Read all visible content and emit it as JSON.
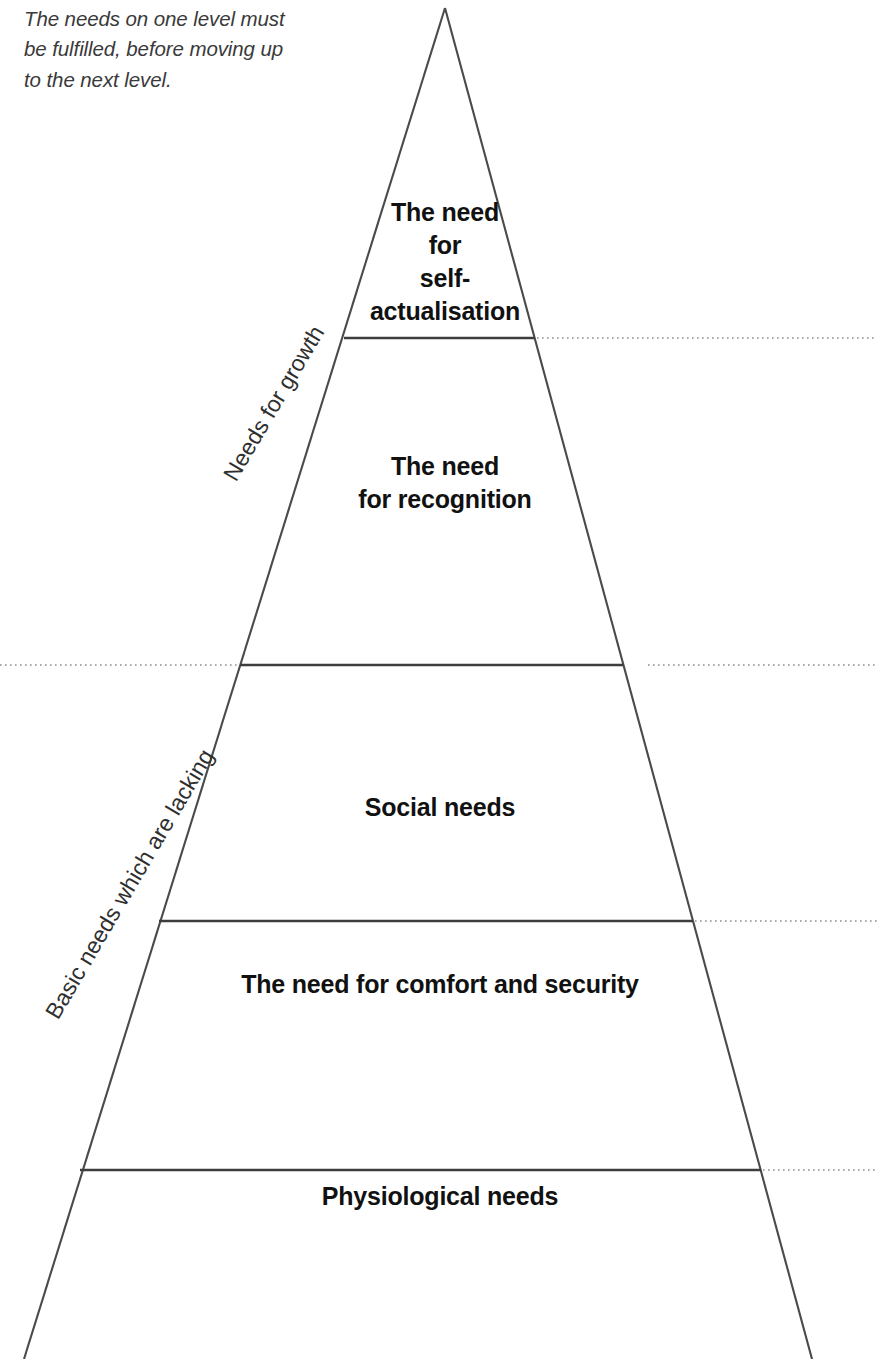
{
  "intro": {
    "text": "The needs on one level must\nbe fulfilled, before moving up\nto the next level."
  },
  "diagram": {
    "apex_x": 445,
    "tiers": [
      {
        "id": "self-actualisation",
        "label": "The need\nfor\nself-\nactualisation",
        "order": 5,
        "divider_y": 338,
        "divider_dotted_side": "right"
      },
      {
        "id": "recognition",
        "label": "The need\nfor recognition",
        "order": 4,
        "divider_y": 665,
        "divider_dotted_side": "both"
      },
      {
        "id": "social",
        "label": "Social needs",
        "order": 3,
        "divider_y": 921,
        "divider_dotted_side": "right"
      },
      {
        "id": "comfort-security",
        "label": "The need for comfort and security",
        "order": 2,
        "divider_y": 1170,
        "divider_dotted_side": "right"
      },
      {
        "id": "physiological",
        "label": "Physiological needs",
        "order": 1,
        "divider_y": null,
        "divider_dotted_side": null
      }
    ],
    "side_labels": [
      {
        "id": "needs-for-growth",
        "label": "Needs for growth",
        "covers": [
          "self-actualisation",
          "recognition"
        ]
      },
      {
        "id": "basic-needs",
        "label": "Basic needs which are lacking",
        "covers": [
          "social",
          "comfort-security",
          "physiological"
        ]
      }
    ],
    "colors": {
      "outline": "#4a4a4a",
      "divider": "#3d3d3d",
      "dotted_guide": "#8e8e8e",
      "label_text": "#111111",
      "intro_text": "#3a3a3a",
      "background": "#ffffff"
    }
  }
}
